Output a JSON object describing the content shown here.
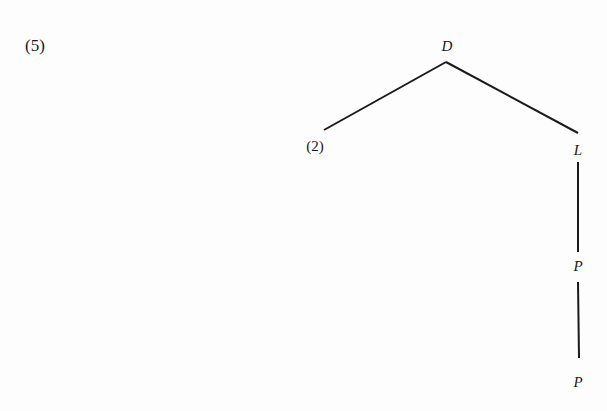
{
  "example_label": "(5)",
  "tree": {
    "root": "D",
    "left_child": "(2)",
    "right_child": "L",
    "chain": [
      "P",
      "P"
    ]
  },
  "colors": {
    "ink": "#1a1a1a",
    "background": "#fdfdfd"
  }
}
